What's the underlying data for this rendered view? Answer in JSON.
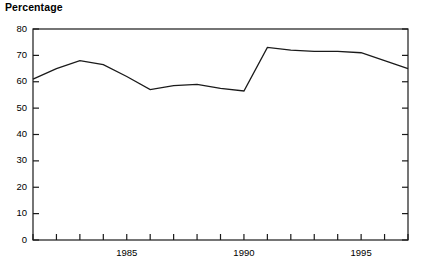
{
  "chart_data": {
    "type": "line",
    "title": "Percentage",
    "xlabel": "",
    "ylabel": "",
    "ylim": [
      0,
      80
    ],
    "xlim": [
      1981,
      1997
    ],
    "grid": false,
    "legend": null,
    "y_ticks": [
      0,
      10,
      20,
      30,
      40,
      50,
      60,
      70,
      80
    ],
    "y_tick_labels": [
      "0",
      "10",
      "20",
      "30",
      "40",
      "50",
      "60",
      "70",
      "80"
    ],
    "x_ticks": [
      1981,
      1982,
      1983,
      1984,
      1985,
      1986,
      1987,
      1988,
      1989,
      1990,
      1991,
      1992,
      1993,
      1994,
      1995,
      1996,
      1997
    ],
    "x_tick_labels_shown": [
      "1985",
      "1990",
      "1995"
    ],
    "x_labeled_ticks": [
      1985,
      1990,
      1995
    ],
    "series": [
      {
        "name": "Percentage",
        "x": [
          1981,
          1982,
          1983,
          1984,
          1985,
          1986,
          1987,
          1988,
          1989,
          1990,
          1991,
          1992,
          1993,
          1994,
          1995,
          1996,
          1997
        ],
        "values": [
          61,
          65,
          68,
          66.5,
          62,
          57,
          58.5,
          59,
          57.5,
          56.5,
          73,
          72,
          71.5,
          71.5,
          71,
          68,
          65
        ]
      }
    ],
    "line_color": "#1a1a1a",
    "axis_color": "#1a1a1a",
    "background_color": "#ffffff"
  }
}
